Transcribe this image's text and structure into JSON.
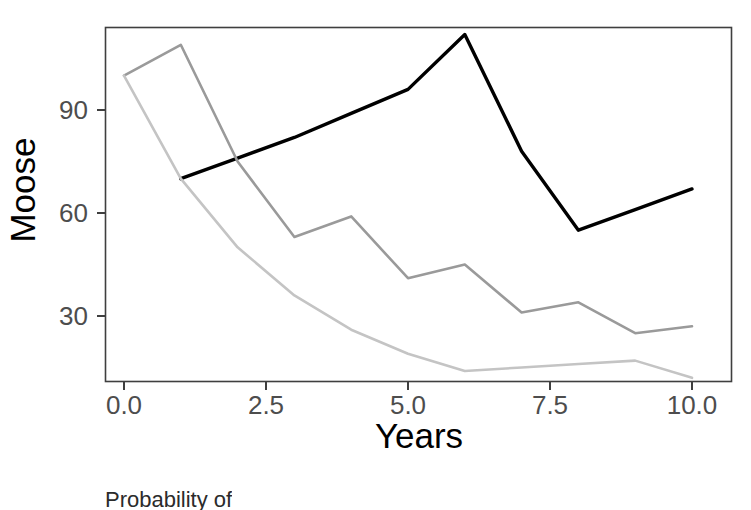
{
  "chart_data": {
    "type": "line",
    "title": "",
    "xlabel": "Years",
    "ylabel": "Moose",
    "xlim": [
      -0.35,
      10.5
    ],
    "ylim": [
      5,
      118
    ],
    "xticks": [
      0.0,
      2.5,
      5.0,
      7.5,
      10.0
    ],
    "xtick_labels": [
      "0.0",
      "2.5",
      "5.0",
      "7.5",
      "10.0"
    ],
    "yticks": [
      30,
      60,
      90
    ],
    "ytick_labels": [
      "30",
      "60",
      "90"
    ],
    "grid": false,
    "legend": "none",
    "panel_border": true,
    "x": [
      0,
      1,
      2,
      3,
      4,
      5,
      6,
      7,
      8,
      9,
      10
    ],
    "series": [
      {
        "name": "black-line",
        "color": "#000000",
        "linewidth": 3.4,
        "x": [
          1,
          2,
          3,
          4,
          5,
          6,
          7,
          8,
          9,
          10
        ],
        "values": [
          70,
          76,
          82,
          89,
          96,
          112,
          78,
          55,
          61,
          67
        ]
      },
      {
        "name": "mid-gray-line",
        "color": "#9a9a9a",
        "linewidth": 2.6,
        "x": [
          0,
          1,
          2,
          3,
          4,
          5,
          6,
          7,
          8,
          9,
          10
        ],
        "values": [
          100,
          109,
          75,
          53,
          59,
          41,
          45,
          31,
          34,
          25,
          27
        ]
      },
      {
        "name": "light-gray-line",
        "color": "#c4c4c4",
        "linewidth": 2.6,
        "x": [
          0,
          1,
          2,
          3,
          4,
          5,
          6,
          7,
          8,
          9,
          10
        ],
        "values": [
          100,
          70,
          50,
          36,
          26,
          19,
          14,
          15,
          16,
          17,
          12
        ]
      }
    ]
  },
  "axes": {
    "ylabel": "Moose",
    "xlabel": "Years",
    "ytick_labels": [
      "90",
      "60",
      "30"
    ],
    "xtick_labels": [
      "0.0",
      "2.5",
      "5.0",
      "7.5",
      "10.0"
    ]
  },
  "caption": {
    "text": "Probability of"
  },
  "colors": {
    "panel_border": "#3f3f3f",
    "axis_text": "#4d4d4d",
    "axis_title": "#000000",
    "background": "#ffffff"
  }
}
